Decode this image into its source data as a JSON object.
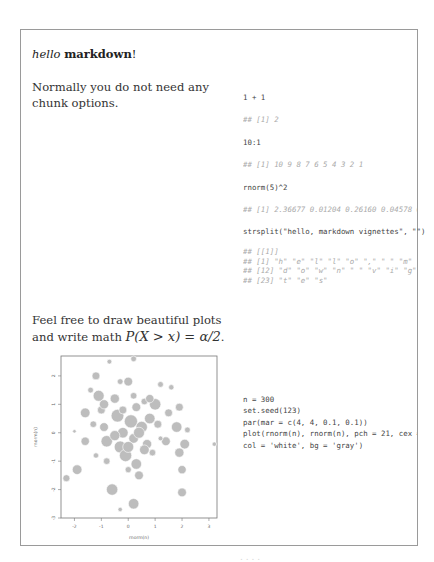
{
  "doc": {
    "title_italic": "hello",
    "title_bold": "markdown",
    "title_suffix": "!",
    "para1": "Normally you do not need any chunk options.",
    "para2_text": "Feel free to draw beautiful plots and write math ",
    "para2_math": "P(X > x) = α/2",
    "para2_suffix": "."
  },
  "code_blocks": [
    {
      "code": "1 + 1",
      "output": "## [1] 2"
    },
    {
      "code": "10:1",
      "output": "## [1] 10  9  8  7  6  5  4  3  2  1"
    },
    {
      "code": "rnorm(5)^2",
      "output": "## [1] 2.36677 0.01204 0.26160 0.04578 0.1"
    },
    {
      "code": "strsplit(\"hello, markdown vignettes\", \"\")",
      "output_lines": [
        "## [[1]]",
        "##  [1] \"h\" \"e\" \"l\" \"l\" \"o\" \",\" \" \" \"m\" \"a",
        "## [12] \"d\" \"o\" \"w\" \"n\" \" \" \"v\" \"i\" \"g\" \"n",
        "## [23] \"t\" \"e\" \"s\""
      ]
    },
    {
      "code_lines": [
        "n = 300",
        "set.seed(123)",
        "par(mar = c(4, 4, 0.1, 0.1))",
        "plot(rnorm(n), rnorm(n), pch = 21, cex = 5",
        "    col = 'white', bg = 'gray')"
      ]
    }
  ],
  "chart_data": {
    "type": "scatter",
    "title": "",
    "xlabel": "rnorm(n)",
    "ylabel": "rnorm(n)",
    "xlim": [
      -2.5,
      3.3
    ],
    "ylim": [
      -3.0,
      2.7
    ],
    "x_ticks": [
      "-2",
      "-1",
      "0",
      "1",
      "2",
      "3"
    ],
    "y_ticks": [
      "-3",
      "-2",
      "-1",
      "0",
      "1",
      "2"
    ],
    "grid": false,
    "marker_fill": "#bdbdbd",
    "marker_edge": "#ffffff",
    "points": [
      [
        -2.3,
        -1.6,
        1.6
      ],
      [
        -1.9,
        -1.3,
        2.2
      ],
      [
        -2.0,
        0.05,
        0.8
      ],
      [
        -1.6,
        -0.3,
        1.9
      ],
      [
        -1.6,
        0.7,
        2.2
      ],
      [
        -1.4,
        1.5,
        1.3
      ],
      [
        -1.2,
        2.0,
        1.8
      ],
      [
        -1.1,
        1.3,
        2.5
      ],
      [
        -1.0,
        0.8,
        1.8
      ],
      [
        -0.9,
        0.2,
        2.0
      ],
      [
        -0.8,
        -0.3,
        2.6
      ],
      [
        -0.8,
        -1.0,
        1.5
      ],
      [
        -0.6,
        -2.0,
        2.6
      ],
      [
        -0.7,
        2.5,
        1.1
      ],
      [
        -0.5,
        1.2,
        2.1
      ],
      [
        -0.4,
        0.6,
        2.9
      ],
      [
        -0.3,
        -0.5,
        2.7
      ],
      [
        -0.3,
        1.8,
        1.3
      ],
      [
        -0.2,
        0.0,
        2.4
      ],
      [
        -0.1,
        -0.8,
        2.8
      ],
      [
        0.0,
        1.8,
        2.0
      ],
      [
        0.1,
        0.4,
        3.0
      ],
      [
        0.2,
        -0.2,
        2.2
      ],
      [
        0.2,
        2.6,
        1.3
      ],
      [
        0.3,
        0.9,
        2.0
      ],
      [
        0.3,
        -1.1,
        2.4
      ],
      [
        0.4,
        -1.5,
        2.0
      ],
      [
        0.5,
        0.2,
        2.6
      ],
      [
        0.6,
        1.1,
        1.5
      ],
      [
        0.7,
        -0.4,
        2.1
      ],
      [
        0.8,
        0.5,
        2.4
      ],
      [
        0.9,
        -0.7,
        1.5
      ],
      [
        1.0,
        1.0,
        2.6
      ],
      [
        1.1,
        0.3,
        1.8
      ],
      [
        1.2,
        1.7,
        1.3
      ],
      [
        1.4,
        -0.3,
        2.0
      ],
      [
        1.5,
        0.7,
        1.8
      ],
      [
        1.6,
        1.6,
        1.2
      ],
      [
        1.8,
        0.2,
        2.4
      ],
      [
        1.9,
        -0.7,
        2.1
      ],
      [
        1.9,
        0.9,
        1.8
      ],
      [
        2.0,
        -1.3,
        1.9
      ],
      [
        2.0,
        -2.1,
        2.0
      ],
      [
        2.1,
        -0.4,
        2.2
      ],
      [
        2.2,
        0.1,
        1.3
      ],
      [
        3.2,
        -0.4,
        1.0
      ],
      [
        -0.3,
        -2.7,
        1.0
      ],
      [
        0.2,
        -2.5,
        2.4
      ],
      [
        0.0,
        -1.3,
        1.4
      ],
      [
        -0.5,
        -0.1,
        2.3
      ],
      [
        0.4,
        0.0,
        2.5
      ],
      [
        0.6,
        -0.6,
        2.2
      ],
      [
        -0.2,
        0.8,
        1.8
      ],
      [
        0.0,
        -0.5,
        2.5
      ],
      [
        1.2,
        -0.2,
        1.1
      ],
      [
        -1.2,
        -0.8,
        1.2
      ],
      [
        -1.3,
        0.3,
        1.5
      ],
      [
        -0.9,
        1.0,
        2.1
      ],
      [
        0.2,
        1.3,
        1.5
      ],
      [
        0.8,
        1.2,
        1.9
      ]
    ]
  },
  "footer_cropped": "                    .    .    .    ."
}
